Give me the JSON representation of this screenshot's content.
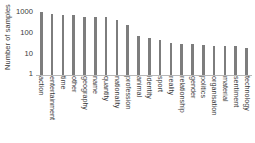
{
  "chart_data": {
    "type": "bar",
    "title": "",
    "xlabel": "",
    "ylabel": "Number of samples",
    "yscale": "log",
    "ylim": [
      1,
      1000
    ],
    "yticks": [
      1000,
      100,
      10,
      1
    ],
    "ytick_labels": [
      "1000",
      "100",
      "10",
      "1"
    ],
    "grid": false,
    "legend": null,
    "bar_color": "#7d7d7d",
    "categories": [
      "action",
      "entertainment",
      "time",
      "other",
      "geography",
      "name",
      "quantity",
      "nationality",
      "profession",
      "animal",
      "identity",
      "sport",
      "reality",
      "relationship",
      "gender",
      "politics",
      "organisation",
      "material",
      "sentiment",
      "technology"
    ],
    "values": [
      1000,
      800,
      760,
      740,
      570,
      560,
      550,
      440,
      250,
      75,
      58,
      48,
      33,
      31,
      30,
      27,
      25,
      24,
      23,
      19
    ]
  }
}
